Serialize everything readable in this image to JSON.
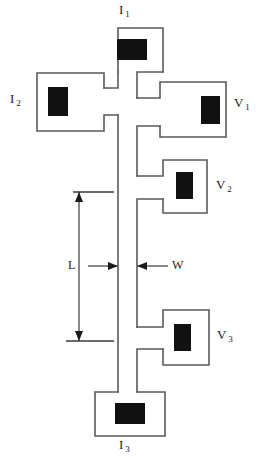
{
  "figure": {
    "type": "hall-bar-device-schematic",
    "background_color": "#ffffff",
    "outline_color": "#5a5a5a",
    "contact_color": "#111111"
  },
  "terminals": {
    "i1": {
      "label": "I",
      "subscript": "1",
      "role": "current-contact",
      "position": "top"
    },
    "i2": {
      "label": "I",
      "subscript": "2",
      "role": "current-contact",
      "position": "left"
    },
    "i3": {
      "label": "I",
      "subscript": "3",
      "role": "current-contact",
      "position": "bottom"
    },
    "v1": {
      "label": "V",
      "subscript": "1",
      "role": "voltage-probe",
      "position": "upper-right"
    },
    "v2": {
      "label": "V",
      "subscript": "2",
      "role": "voltage-probe",
      "position": "middle-right"
    },
    "v3": {
      "label": "V",
      "subscript": "3",
      "role": "voltage-probe",
      "position": "lower-right"
    }
  },
  "dimensions": {
    "length": {
      "label": "L",
      "description": "channel length between voltage probes"
    },
    "width": {
      "label": "W",
      "description": "channel width of central bar"
    }
  },
  "geometry": {
    "channel": {
      "x_left": 118,
      "x_right": 137,
      "y_top": 72,
      "y_bottom": 392
    },
    "pad_i1": {
      "x": 97,
      "y": 28,
      "w": 66,
      "h": 44
    },
    "pad_i2": {
      "x": 37,
      "y": 73,
      "w": 67,
      "h": 58
    },
    "pad_i3": {
      "x": 95,
      "y": 392,
      "w": 70,
      "h": 44
    },
    "pad_v1": {
      "x": 160,
      "y": 82,
      "w": 66,
      "h": 55
    },
    "pad_v2": {
      "x": 163,
      "y": 160,
      "w": 44,
      "h": 53
    },
    "pad_v3": {
      "x": 163,
      "y": 310,
      "w": 46,
      "h": 55
    },
    "dim_L": {
      "x_axis": 79,
      "y_top": 192,
      "y_bottom": 341
    },
    "dim_W": {
      "y": 266,
      "x_left_start": 88,
      "x_right_end": 168
    }
  }
}
